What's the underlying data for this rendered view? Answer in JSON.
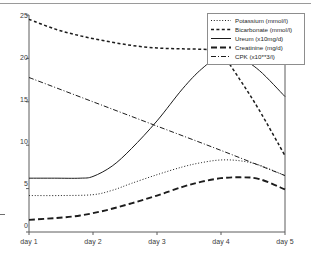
{
  "chart_data": {
    "type": "line",
    "title": "",
    "subtitle": "",
    "xlabel": "",
    "ylabel": "",
    "xlim": [
      1,
      5
    ],
    "ylim": [
      0,
      25
    ],
    "grid": false,
    "legend_position": "top-right",
    "x": [
      1,
      5
    ],
    "x_tick_labels": [
      "day 1",
      "day 2",
      "day 3",
      "day 4",
      "day 5"
    ],
    "x_tick_values": [
      1,
      2,
      3,
      4,
      5
    ],
    "y_tick_labels": [
      "0",
      "5",
      "10",
      "15",
      "20",
      "25"
    ],
    "y_tick_values": [
      0,
      5,
      10,
      15,
      20,
      25
    ],
    "series": [
      {
        "name": "Potassium (mmol/l)",
        "style": "dotted",
        "x": [
          1.0,
          1.5,
          2.0,
          2.3,
          2.6,
          3.0,
          3.4,
          3.7,
          4.0,
          4.3,
          4.6,
          5.0
        ],
        "values": [
          4.2,
          4.2,
          4.3,
          4.8,
          5.6,
          6.6,
          7.5,
          8.0,
          8.3,
          8.2,
          7.7,
          6.5
        ]
      },
      {
        "name": "Bicarbonate (mmol/l)",
        "style": "dashed-short",
        "x": [
          1.0,
          1.4,
          1.8,
          2.2,
          2.6,
          3.0,
          3.4,
          3.8,
          4.0,
          4.3,
          4.6,
          5.0
        ],
        "values": [
          24.5,
          23.4,
          22.6,
          22.0,
          21.5,
          21.2,
          21.1,
          21.0,
          20.6,
          17.5,
          14.0,
          8.8
        ]
      },
      {
        "name": "Ureum (x10mg/d)",
        "style": "solid",
        "x": [
          1.0,
          1.4,
          1.8,
          2.0,
          2.3,
          2.6,
          3.0,
          3.4,
          3.7,
          4.0,
          4.3,
          4.6,
          5.0
        ],
        "values": [
          6.2,
          6.2,
          6.2,
          6.4,
          7.6,
          9.6,
          12.8,
          16.5,
          18.8,
          20.3,
          20.0,
          18.6,
          15.6
        ]
      },
      {
        "name": "Creatinine (mg/d)",
        "style": "dashed-long",
        "x": [
          1.0,
          1.4,
          1.8,
          2.2,
          2.6,
          3.0,
          3.4,
          3.7,
          4.0,
          4.3,
          4.6,
          5.0
        ],
        "values": [
          1.4,
          1.6,
          1.9,
          2.5,
          3.3,
          4.2,
          5.2,
          5.8,
          6.2,
          6.3,
          6.1,
          4.9
        ]
      },
      {
        "name": "CPK (x10**3/l)",
        "style": "dash-dot",
        "x": [
          1.0,
          2.0,
          3.0,
          4.0,
          5.0
        ],
        "values": [
          17.8,
          15.0,
          12.2,
          9.4,
          6.5
        ]
      }
    ]
  },
  "legend": {
    "items": [
      {
        "label": "Potassium (mmol/l)"
      },
      {
        "label": "Bicarbonate (mmol/l)"
      },
      {
        "label": "Ureum (x10mg/d)"
      },
      {
        "label": "Creatinine (mg/d)"
      },
      {
        "label": "CPK (x10**3/l)"
      }
    ]
  },
  "axes": {
    "y_labels": [
      "25",
      "20",
      "15",
      "10",
      "5",
      "0"
    ],
    "x_labels": [
      "day 1",
      "day 2",
      "day 3",
      "day 4",
      "day 5"
    ]
  },
  "colors": {
    "line": "#1c1c1c",
    "axis": "#5d5d5d",
    "text": "#2b2b2b",
    "background": "#ffffff"
  }
}
